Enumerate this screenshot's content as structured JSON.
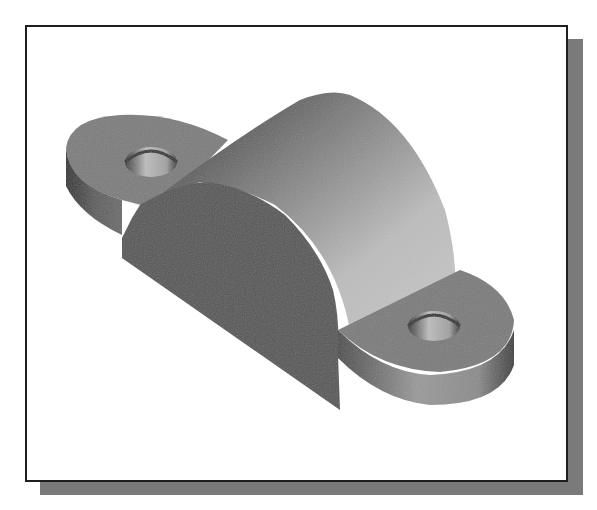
{
  "figure": {
    "frame": {
      "border_color": "#1e1e1e",
      "background": "#ffffff"
    },
    "shadow": {
      "color": "#7a7a7a",
      "offset_px": 15
    },
    "shading": {
      "front_face": "#555555",
      "cylinder_dark": "#3c3c3c",
      "cylinder_light": "#bdbdbd",
      "boss_top": "#7a7a7a",
      "boss_side": "#5a5a5a",
      "hole_inner": "#b5b5b5"
    }
  }
}
